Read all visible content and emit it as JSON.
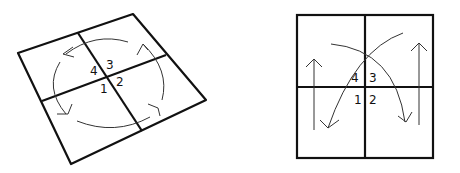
{
  "figures": [
    {
      "name": "perspective-grid",
      "description": "Tilted 2x2 grid with circular arrows around center",
      "quadrant_labels": [
        "1",
        "2",
        "3",
        "4"
      ]
    },
    {
      "name": "flat-grid",
      "description": "Flat 2x2 grid with crossing arcs and vertical arrows",
      "quadrant_labels": [
        "1",
        "2",
        "3",
        "4"
      ]
    }
  ],
  "colors": {
    "stroke": "#111111",
    "arrow": "#333333",
    "background": "#ffffff"
  }
}
